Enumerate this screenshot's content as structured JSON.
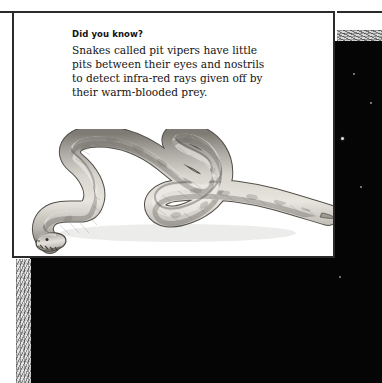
{
  "page": {
    "kind": "book-page-scan",
    "background_color": "#ffffff"
  },
  "night_sky": {
    "name": "starfield",
    "background_color": "#050505",
    "star_count": 52,
    "stars": [
      {
        "x": 300,
        "y": 24,
        "r": 1.9,
        "b": 1.0
      },
      {
        "x": 268,
        "y": 43,
        "r": 1.3,
        "b": 0.78
      },
      {
        "x": 211,
        "y": 50,
        "r": 1.2,
        "b": 0.72
      },
      {
        "x": 324,
        "y": 33,
        "r": 0.8,
        "b": 0.52
      },
      {
        "x": 341,
        "y": 62,
        "r": 1.0,
        "b": 0.6
      },
      {
        "x": 312,
        "y": 97,
        "r": 1.5,
        "b": 0.88
      },
      {
        "x": 286,
        "y": 124,
        "r": 1.1,
        "b": 0.66
      },
      {
        "x": 331,
        "y": 146,
        "r": 1.0,
        "b": 0.58
      },
      {
        "x": 296,
        "y": 178,
        "r": 0.8,
        "b": 0.48
      },
      {
        "x": 2,
        "y": 11,
        "r": 1.1,
        "b": 0.7
      },
      {
        "x": 22,
        "y": 27,
        "r": 1.0,
        "b": 0.6
      },
      {
        "x": 30,
        "y": 31,
        "r": 1.4,
        "b": 0.82
      },
      {
        "x": 50,
        "y": 28,
        "r": 0.7,
        "b": 0.42
      },
      {
        "x": 17,
        "y": 49,
        "r": 1.5,
        "b": 0.86
      },
      {
        "x": 73,
        "y": 47,
        "r": 0.9,
        "b": 0.54
      },
      {
        "x": 129,
        "y": 29,
        "r": 1.4,
        "b": 0.84
      },
      {
        "x": 160,
        "y": 33,
        "r": 1.0,
        "b": 0.58
      },
      {
        "x": 198,
        "y": 26,
        "r": 1.6,
        "b": 0.92
      },
      {
        "x": 176,
        "y": 48,
        "r": 0.9,
        "b": 0.52
      },
      {
        "x": 186,
        "y": 46,
        "r": 0.7,
        "b": 0.4
      },
      {
        "x": 133,
        "y": 47,
        "r": 0.7,
        "b": 0.4
      },
      {
        "x": 18,
        "y": 70,
        "r": 1.5,
        "b": 0.88
      },
      {
        "x": 28,
        "y": 72,
        "r": 2.0,
        "b": 1.0
      },
      {
        "x": 142,
        "y": 64,
        "r": 1.2,
        "b": 0.7
      },
      {
        "x": 203,
        "y": 64,
        "r": 0.8,
        "b": 0.44
      },
      {
        "x": 223,
        "y": 62,
        "r": 1.7,
        "b": 0.96
      },
      {
        "x": 256,
        "y": 63,
        "r": 1.5,
        "b": 0.86
      },
      {
        "x": 290,
        "y": 61,
        "r": 1.2,
        "b": 0.68
      },
      {
        "x": 249,
        "y": 71,
        "r": 1.4,
        "b": 0.8
      },
      {
        "x": 252,
        "y": 78,
        "r": 1.1,
        "b": 0.62
      },
      {
        "x": 132,
        "y": 74,
        "r": 1.3,
        "b": 0.76
      },
      {
        "x": 125,
        "y": 78,
        "r": 1.5,
        "b": 0.86
      },
      {
        "x": 198,
        "y": 70,
        "r": 0.7,
        "b": 0.4
      },
      {
        "x": 285,
        "y": 78,
        "r": 0.7,
        "b": 0.38
      },
      {
        "x": 80,
        "y": 83,
        "r": 0.8,
        "b": 0.44
      },
      {
        "x": 171,
        "y": 86,
        "r": 1.1,
        "b": 0.62
      },
      {
        "x": 116,
        "y": 89,
        "r": 0.6,
        "b": 0.34
      },
      {
        "x": 55,
        "y": 98,
        "r": 0.9,
        "b": 0.5
      },
      {
        "x": 94,
        "y": 96,
        "r": 1.6,
        "b": 0.92
      },
      {
        "x": 71,
        "y": 104,
        "r": 1.4,
        "b": 0.82
      },
      {
        "x": 89,
        "y": 108,
        "r": 1.5,
        "b": 0.88
      },
      {
        "x": 160,
        "y": 102,
        "r": 1.1,
        "b": 0.6
      },
      {
        "x": 149,
        "y": 110,
        "r": 1.2,
        "b": 0.68
      },
      {
        "x": 212,
        "y": 101,
        "r": 0.9,
        "b": 0.5
      },
      {
        "x": 226,
        "y": 107,
        "r": 1.3,
        "b": 0.74
      },
      {
        "x": 135,
        "y": 115,
        "r": 0.7,
        "b": 0.38
      },
      {
        "x": 264,
        "y": 113,
        "r": 0.9,
        "b": 0.5
      },
      {
        "x": 40,
        "y": 121,
        "r": 0.7,
        "b": 0.36
      },
      {
        "x": 190,
        "y": 128,
        "r": 1.0,
        "b": 0.54
      },
      {
        "x": 253,
        "y": 132,
        "r": 0.8,
        "b": 0.44
      },
      {
        "x": 310,
        "y": 236,
        "r": 1.0,
        "b": 0.56
      },
      {
        "x": 96,
        "y": 190,
        "r": 0.8,
        "b": 0.42
      }
    ]
  },
  "grain_strips": [
    {
      "name": "left-edge-grain",
      "orientation": "vertical"
    },
    {
      "name": "top-right-grain",
      "orientation": "horizontal"
    }
  ],
  "rules": [
    {
      "name": "rule-left",
      "color": "#2a2a2a"
    },
    {
      "name": "rule-right",
      "color": "#2a2a2a"
    }
  ],
  "fact_card": {
    "border_color": "#2b2b2b",
    "background_color": "#ffffff",
    "heading": "Did you know?",
    "body_lines": [
      "Snakes called pit vipers have little",
      "pits between their eyes and nostrils",
      "to detect infra-red rays given off by",
      "their warm-blooded prey."
    ],
    "body_text": "Snakes called pit vipers have little pits between their eyes and nostrils to detect infra-red rays given off by their warm-blooded prey.",
    "illustration": {
      "name": "snake-illustration",
      "subject": "pit viper snake",
      "style": "grayscale pen-and-ink drawing",
      "body_color": "#cfcbc4",
      "shadow_color": "#8a8780",
      "outline_color": "#4a4742",
      "head_position": "lower-left",
      "tail_position": "right"
    }
  }
}
